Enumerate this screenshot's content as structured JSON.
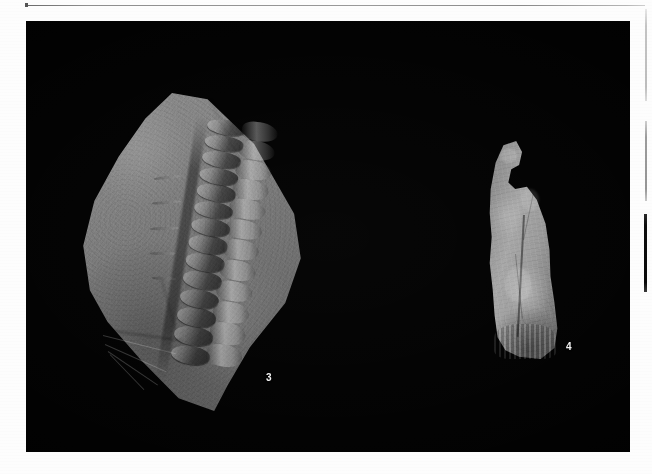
{
  "page": {
    "type": "scanned-plate",
    "background_color": "#fdfdfd",
    "plate_background_color": "#010101"
  },
  "rules": {
    "top_rule_name": "top-horizontal-rule",
    "margin_rule_1_name": "right-margin-rule-light",
    "margin_rule_2_name": "right-margin-rule-gray",
    "margin_rule_3_name": "right-margin-rule-dark"
  },
  "figures": [
    {
      "label": "3",
      "caption": "",
      "subject": "fossil vertebral column preserved on rock slab",
      "position": "left"
    },
    {
      "label": "4",
      "caption": "",
      "subject": "isolated fossil bone specimen",
      "position": "right"
    }
  ]
}
